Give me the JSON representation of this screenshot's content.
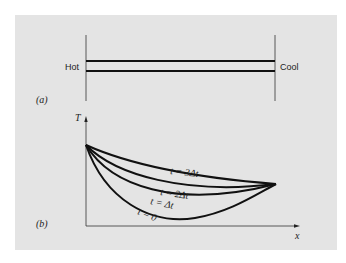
{
  "figure": {
    "panel_a": {
      "label": "(a)",
      "left_label": "Hot",
      "right_label": "Cool"
    },
    "panel_b": {
      "label": "(b)",
      "y_axis_label": "T",
      "x_axis_label": "x",
      "curves": [
        {
          "label": "t = 3Δt"
        },
        {
          "label": "t = 2Δt"
        },
        {
          "label": "t = Δt"
        },
        {
          "label": "t = 0"
        }
      ]
    },
    "colors": {
      "background": "#e4e4e4",
      "ink": "#222222"
    }
  }
}
